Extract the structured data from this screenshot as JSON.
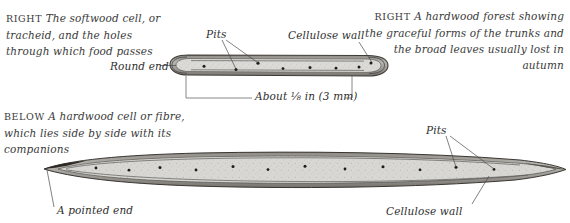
{
  "page": {
    "width": 570,
    "height": 223,
    "background": "#ffffff",
    "ink": "#2b2b2b"
  },
  "captions": {
    "softwood": {
      "lead": "RIGHT",
      "text": "The softwood cell, or tracheid, and the holes through which food passes"
    },
    "forest": {
      "lead": "RIGHT",
      "text": "A hardwood forest showing the graceful forms of the trunks and the broad leaves usually lost in autumn"
    },
    "hardwood": {
      "lead": "BELOW",
      "text": "A hardwood cell or fibre, which lies side by side with its companions"
    }
  },
  "annotations": {
    "pits_top": "Pits",
    "cellulose_wall_top": "Cellulose wall",
    "round_end": "Round end",
    "scale": "About ⅛ in (3 mm)",
    "pits_bottom": "Pits",
    "pointed_end": "A pointed end",
    "cellulose_wall_bottom": "Cellulose wall"
  },
  "figures": {
    "softwood_cell": {
      "name": "softwood-tracheid",
      "end_shape": "round",
      "length_label": "About ⅛ in (3 mm)",
      "pit_count": 8
    },
    "hardwood_fibre": {
      "name": "hardwood-fibre",
      "end_shape": "pointed",
      "pit_count": 12
    }
  },
  "colors": {
    "ink": "#2b2b2b",
    "leader": "#4a4a4a",
    "cell_fill": "#d8d6d2",
    "cell_wall": "#4d4d4d",
    "pit": "#1d1d1d"
  }
}
